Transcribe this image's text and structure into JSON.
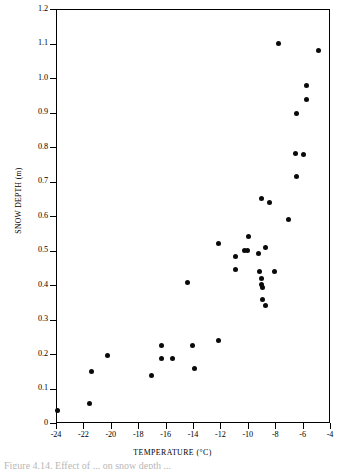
{
  "figure": {
    "caption": "Figure 4.14. Effect of ... on snow depth ..."
  },
  "chart_data": {
    "type": "scatter",
    "title": "",
    "xlabel": "TEMPERATURE (°C)",
    "ylabel": "SNOW DEPTH (m)",
    "xlim": [
      -24,
      -4
    ],
    "ylim": [
      0,
      1.2
    ],
    "grid": false,
    "legend": null,
    "xticks": [
      -24,
      -22,
      -20,
      -18,
      -16,
      -14,
      -12,
      -10,
      -8,
      -6,
      -4
    ],
    "xtick_labels": [
      "-24",
      "-22",
      "-20",
      "-18",
      "-16",
      "-14",
      "-12",
      "-10",
      "-8",
      "-6",
      "-4"
    ],
    "yticks": [
      0,
      0.1,
      0.2,
      0.3,
      0.4,
      0.5,
      0.6,
      0.7,
      0.8,
      0.9,
      1.0,
      1.1,
      1.2
    ],
    "ytick_labels": [
      "0",
      "0.1",
      "0.2",
      "0.3",
      "0.4",
      "0.5",
      "0.6",
      "0.7",
      "0.8",
      "0.9",
      "1.0",
      "1.1",
      "1.2"
    ],
    "marker": "filled-circle",
    "marker_color": "#0a0a0a",
    "points": [
      {
        "x": -24.0,
        "y": 0.04
      },
      {
        "x": -21.6,
        "y": 0.059
      },
      {
        "x": -21.5,
        "y": 0.152
      },
      {
        "x": -20.3,
        "y": 0.2
      },
      {
        "x": -17.1,
        "y": 0.141
      },
      {
        "x": -16.4,
        "y": 0.228
      },
      {
        "x": -16.4,
        "y": 0.191
      },
      {
        "x": -15.6,
        "y": 0.191
      },
      {
        "x": -14.5,
        "y": 0.41
      },
      {
        "x": -14.1,
        "y": 0.228
      },
      {
        "x": -14.0,
        "y": 0.162
      },
      {
        "x": -12.2,
        "y": 0.242
      },
      {
        "x": -12.2,
        "y": 0.522
      },
      {
        "x": -11.0,
        "y": 0.485
      },
      {
        "x": -11.0,
        "y": 0.449
      },
      {
        "x": -10.3,
        "y": 0.502
      },
      {
        "x": -10.1,
        "y": 0.503
      },
      {
        "x": -10.0,
        "y": 0.543
      },
      {
        "x": -9.3,
        "y": 0.494
      },
      {
        "x": -9.2,
        "y": 0.441
      },
      {
        "x": -9.1,
        "y": 0.421
      },
      {
        "x": -9.1,
        "y": 0.404
      },
      {
        "x": -9.0,
        "y": 0.395
      },
      {
        "x": -9.0,
        "y": 0.361
      },
      {
        "x": -8.8,
        "y": 0.343
      },
      {
        "x": -8.8,
        "y": 0.512
      },
      {
        "x": -9.1,
        "y": 0.655
      },
      {
        "x": -8.5,
        "y": 0.643
      },
      {
        "x": -8.1,
        "y": 0.442
      },
      {
        "x": -7.8,
        "y": 1.103
      },
      {
        "x": -7.1,
        "y": 0.592
      },
      {
        "x": -6.6,
        "y": 0.783
      },
      {
        "x": -6.5,
        "y": 0.9
      },
      {
        "x": -6.5,
        "y": 0.718
      },
      {
        "x": -6.0,
        "y": 0.781
      },
      {
        "x": -5.8,
        "y": 0.981
      },
      {
        "x": -5.8,
        "y": 0.94
      },
      {
        "x": -4.9,
        "y": 1.083
      }
    ]
  }
}
